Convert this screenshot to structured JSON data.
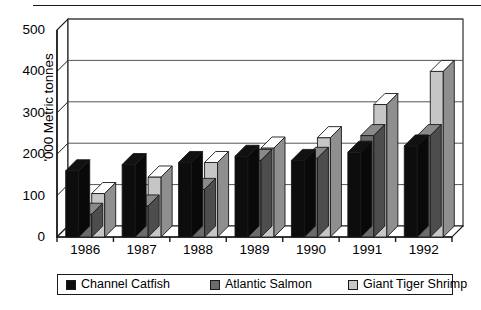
{
  "chart_data": {
    "type": "bar",
    "title": "",
    "xlabel": "",
    "ylabel": "'000 Metric tonnes",
    "categories": [
      "1986",
      "1987",
      "1988",
      "1989",
      "1990",
      "1991",
      "1992"
    ],
    "ylim": [
      0,
      500
    ],
    "yticks": [
      0,
      100,
      200,
      300,
      400,
      500
    ],
    "grid": true,
    "legend_position": "bottom",
    "style": "3d-clustered-column",
    "series": [
      {
        "name": "Channel Catfish",
        "color": "#0d0d0d",
        "values": [
          160,
          175,
          180,
          195,
          185,
          205,
          220
        ]
      },
      {
        "name": "Atlantic Salmon",
        "color": "#6b6b6b",
        "values": [
          55,
          75,
          115,
          185,
          190,
          245,
          245
        ]
      },
      {
        "name": "Giant Tiger Shrimp",
        "color": "#c6c6c6",
        "values": [
          105,
          145,
          180,
          215,
          240,
          320,
          400
        ]
      }
    ]
  },
  "legend": {
    "items": [
      {
        "label": "Channel Catfish",
        "color": "#0d0d0d"
      },
      {
        "label": "Atlantic Salmon",
        "color": "#6b6b6b"
      },
      {
        "label": "Giant Tiger Shrimp",
        "color": "#c6c6c6"
      }
    ]
  },
  "colors": {
    "axis": "#1a1a1a",
    "grid": "#555555",
    "background": "#ffffff",
    "catfish": "#0d0d0d",
    "salmon": "#6b6b6b",
    "shrimp": "#c6c6c6"
  }
}
